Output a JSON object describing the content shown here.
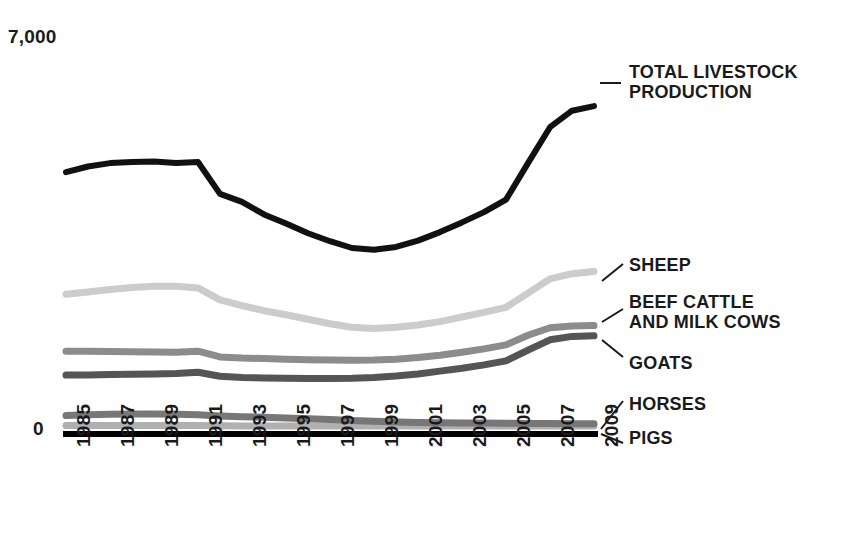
{
  "chart_data": {
    "type": "line",
    "title": "",
    "xlabel": "",
    "ylabel": "",
    "ylim": [
      0,
      7000
    ],
    "xlim": [
      1985,
      2009
    ],
    "grid": false,
    "legend_position": "right-inline-labels",
    "y_ticks": [
      "0",
      "7,000"
    ],
    "x": [
      1985,
      1986,
      1987,
      1988,
      1989,
      1990,
      1991,
      1992,
      1993,
      1994,
      1995,
      1996,
      1997,
      1998,
      1999,
      2000,
      2001,
      2002,
      2003,
      2004,
      2005,
      2006,
      2007,
      2008,
      2009
    ],
    "x_tick_labels": [
      "1985",
      "1987",
      "1989",
      "1991",
      "1993",
      "1995",
      "1997",
      "1999",
      "2001",
      "2003",
      "2005",
      "2007",
      "2009"
    ],
    "series": [
      {
        "name": "TOTAL LIVESTOCK PRODUCTION",
        "color": "#111111",
        "width": 6,
        "values": [
          4540,
          4640,
          4700,
          4720,
          4730,
          4700,
          4720,
          4160,
          4020,
          3800,
          3640,
          3470,
          3330,
          3210,
          3180,
          3230,
          3340,
          3490,
          3660,
          3840,
          4060,
          4700,
          5330,
          5620,
          5700
        ]
      },
      {
        "name": "SHEEP",
        "color": "#cccccc",
        "width": 7,
        "values": [
          2400,
          2440,
          2480,
          2520,
          2540,
          2540,
          2510,
          2300,
          2200,
          2110,
          2040,
          1960,
          1880,
          1820,
          1800,
          1820,
          1860,
          1920,
          2000,
          2080,
          2170,
          2420,
          2670,
          2760,
          2800
        ]
      },
      {
        "name": "BEEF CATTLE AND MILK COWS",
        "color": "#8c8c8c",
        "width": 7,
        "values": [
          1400,
          1400,
          1395,
          1390,
          1385,
          1380,
          1400,
          1300,
          1280,
          1270,
          1260,
          1250,
          1245,
          1240,
          1245,
          1260,
          1290,
          1330,
          1380,
          1440,
          1510,
          1680,
          1810,
          1840,
          1850
        ]
      },
      {
        "name": "GOATS",
        "color": "#555555",
        "width": 7,
        "values": [
          980,
          985,
          990,
          995,
          1000,
          1010,
          1030,
          960,
          940,
          930,
          925,
          920,
          920,
          925,
          940,
          965,
          1000,
          1050,
          1100,
          1160,
          1230,
          1420,
          1600,
          1660,
          1670
        ]
      },
      {
        "name": "HORSES",
        "color": "#777777",
        "width": 7,
        "values": [
          270,
          285,
          295,
          300,
          300,
          295,
          285,
          265,
          250,
          240,
          230,
          215,
          200,
          185,
          170,
          160,
          150,
          145,
          140,
          138,
          135,
          132,
          130,
          128,
          128
        ]
      },
      {
        "name": "PIGS",
        "color": "#b0b0b0",
        "width": 7,
        "values": [
          95,
          95,
          95,
          95,
          95,
          95,
          95,
          92,
          90,
          90,
          90,
          90,
          90,
          90,
          90,
          90,
          90,
          90,
          90,
          90,
          90,
          90,
          90,
          90,
          90
        ]
      }
    ]
  },
  "axis": {
    "y_top": "7,000",
    "y_zero": "0",
    "baseline_color": "#000000"
  },
  "x_ticks": [
    {
      "label": "1985"
    },
    {
      "label": "1987"
    },
    {
      "label": "1989"
    },
    {
      "label": "1991"
    },
    {
      "label": "1993"
    },
    {
      "label": "1995"
    },
    {
      "label": "1997"
    },
    {
      "label": "1999"
    },
    {
      "label": "2001"
    },
    {
      "label": "2003"
    },
    {
      "label": "2005"
    },
    {
      "label": "2007"
    },
    {
      "label": "2009"
    }
  ],
  "legend": {
    "total": "TOTAL LIVESTOCK\nPRODUCTION",
    "sheep": "SHEEP",
    "beef": "BEEF CATTLE\nAND MILK COWS",
    "goats": "GOATS",
    "horses": "HORSES",
    "pigs": "PIGS"
  }
}
